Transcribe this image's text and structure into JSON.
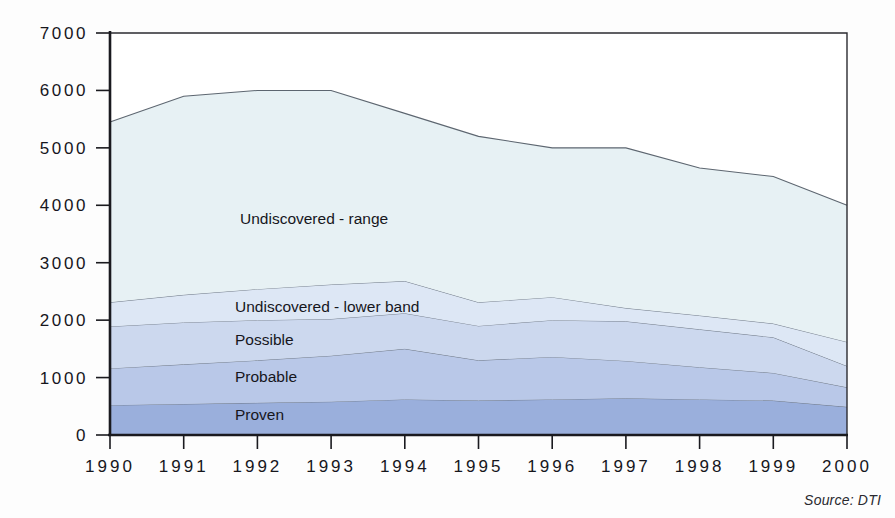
{
  "chart_data": {
    "type": "area",
    "stacked": true,
    "title": "",
    "subtitle": "",
    "xlabel": "",
    "ylabel": "",
    "categories": [
      "1990",
      "1991",
      "1992",
      "1993",
      "1994",
      "1995",
      "1996",
      "1997",
      "1998",
      "1999",
      "2000"
    ],
    "x": [
      1990,
      1991,
      1992,
      1993,
      1994,
      1995,
      1996,
      1997,
      1998,
      1999,
      2000
    ],
    "xlim": [
      1990,
      2000
    ],
    "ylim": [
      0,
      7000
    ],
    "ytick_labels": [
      "0",
      "1000",
      "2000",
      "3000",
      "4000",
      "5000",
      "6000",
      "7000"
    ],
    "yticks": [
      0,
      1000,
      2000,
      3000,
      4000,
      5000,
      6000,
      7000
    ],
    "grid": false,
    "legend": "inline-labels",
    "series": [
      {
        "name": "Proven",
        "color": "#9aafdc",
        "values": [
          520,
          540,
          560,
          580,
          620,
          600,
          620,
          640,
          620,
          600,
          490
        ]
      },
      {
        "name": "Probable",
        "color": "#b9c8e8",
        "values": [
          640,
          690,
          740,
          800,
          880,
          700,
          740,
          650,
          560,
          480,
          340
        ]
      },
      {
        "name": "Possible",
        "color": "#ccd8ee",
        "values": [
          730,
          730,
          700,
          640,
          620,
          600,
          640,
          690,
          660,
          620,
          370
        ]
      },
      {
        "name": "Undiscovered - lower band",
        "color": "#dde7f5",
        "values": [
          420,
          480,
          540,
          600,
          560,
          410,
          400,
          230,
          240,
          240,
          420
        ]
      },
      {
        "name": "Undiscovered - range",
        "color": "#e7f1f4",
        "values": [
          3140,
          3460,
          3460,
          3380,
          2920,
          2890,
          2600,
          2790,
          2570,
          2560,
          2380
        ]
      }
    ],
    "cumulative_tops": {
      "Proven": [
        520,
        540,
        560,
        580,
        620,
        600,
        620,
        640,
        620,
        600,
        490
      ],
      "Probable": [
        1160,
        1230,
        1300,
        1380,
        1500,
        1300,
        1360,
        1290,
        1180,
        1080,
        830
      ],
      "Possible": [
        1890,
        1960,
        2000,
        2020,
        2120,
        1900,
        2000,
        1980,
        1840,
        1700,
        1200
      ],
      "Undiscovered - lower band": [
        2310,
        2440,
        2540,
        2620,
        2680,
        2310,
        2400,
        2210,
        2080,
        1940,
        1620
      ],
      "Undiscovered - range": [
        5450,
        5900,
        6000,
        6000,
        5600,
        5200,
        5000,
        5000,
        4650,
        4500,
        4000
      ]
    },
    "series_inline_labels": [
      {
        "text": "Undiscovered - range",
        "x_pos_px": 240,
        "y_pos_px": 224
      },
      {
        "text": "Undiscovered - lower band",
        "x_pos_px": 235,
        "y_pos_px": 312
      },
      {
        "text": "Possible",
        "x_pos_px": 235,
        "y_pos_px": 345
      },
      {
        "text": "Probable",
        "x_pos_px": 235,
        "y_pos_px": 382
      },
      {
        "text": "Proven",
        "x_pos_px": 235,
        "y_pos_px": 420
      }
    ],
    "source_note": "Source: DTI",
    "colors": {
      "proven": "#9aafdc",
      "probable": "#b9c8e8",
      "possible": "#ccd8ee",
      "undiscovered_lower_band": "#dde7f5",
      "undiscovered_range": "#e7f1f4",
      "axis": "#1a1a1f",
      "text": "#16161c",
      "background": "#fdfdfd"
    }
  }
}
